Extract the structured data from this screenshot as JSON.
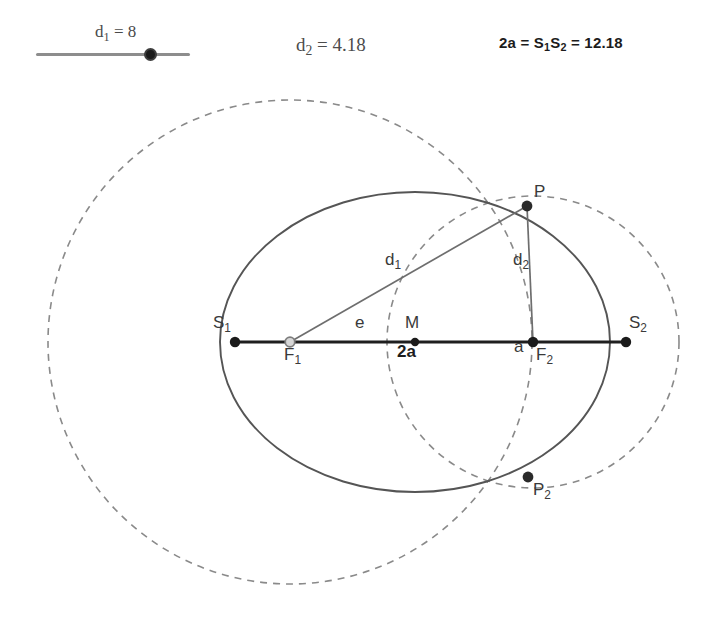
{
  "canvas": {
    "width": 725,
    "height": 632,
    "background": "#ffffff"
  },
  "slider": {
    "name": "d1-slider",
    "label_prefix": "d",
    "label_sub": "1",
    "label_text": "d₁ = 8",
    "value": 8,
    "handle_percent": 73
  },
  "readouts": [
    {
      "id": "d2",
      "text": "d₂ = 4.18",
      "value": 4.18
    },
    {
      "id": "sum",
      "text": "2a = S₁S₂ = 12.18",
      "value": 12.18
    }
  ],
  "labels": {
    "S1": "S",
    "S1_sub": "1",
    "S2": "S",
    "S2_sub": "2",
    "F1": "F",
    "F1_sub": "1",
    "F2": "F",
    "F2_sub": "2",
    "M": "M",
    "P": "P",
    "P2": "P",
    "P2_sub": "2",
    "d1": "d",
    "d1_sub": "1",
    "d2": "d",
    "d2_sub": "2",
    "e": "e",
    "a": "a",
    "two_a": "2a"
  },
  "colors": {
    "ellipse": "#555555",
    "dashed_circle": "#8a8a8a",
    "axis": "#1f1f1f",
    "segment": "#6e6e6e",
    "point_fill": "#1b1b1b",
    "point_hollow_stroke": "#8a8a8a",
    "text": "#3a3a3a",
    "text_bold": "#1d1d1d",
    "slider_track": "#8d8d8d"
  },
  "geometry": {
    "center_M": {
      "x": 415,
      "y": 342
    },
    "semi_major_px": 195,
    "semi_minor_px": 150,
    "F1": {
      "x": 290,
      "y": 342
    },
    "F2": {
      "x": 533,
      "y": 342
    },
    "S1": {
      "x": 235,
      "y": 342
    },
    "S2": {
      "x": 626,
      "y": 342
    },
    "P": {
      "x": 527,
      "y": 206
    },
    "P2": {
      "x": 528,
      "y": 477
    },
    "circle_F1_radius_px": 242,
    "circle_F2_radius_px": 146,
    "px_per_unit": 30.2
  }
}
